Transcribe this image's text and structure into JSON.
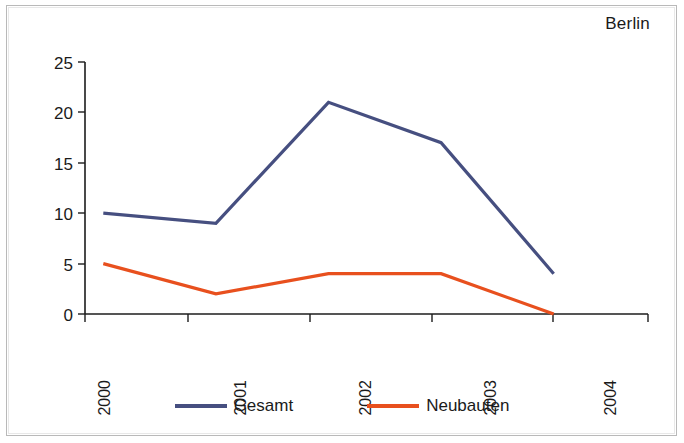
{
  "chart_data": {
    "type": "line",
    "title": "Berlin",
    "xlabel": "",
    "ylabel": "",
    "categories": [
      "2000",
      "2001",
      "2002",
      "2003",
      "2004"
    ],
    "series": [
      {
        "name": "Gesamt",
        "color": "#464f80",
        "values": [
          10,
          9,
          21,
          17,
          4
        ]
      },
      {
        "name": "Neubauten",
        "color": "#e8501e",
        "values": [
          5,
          2,
          4,
          4,
          0
        ]
      }
    ],
    "ylim": [
      0,
      25
    ],
    "yticks": [
      0,
      5,
      10,
      15,
      20,
      25
    ],
    "grid": false,
    "legend_position": "bottom",
    "xtick_rotation": -90
  },
  "legend": {
    "entries": [
      {
        "label": "Gesamt",
        "color": "#464f80"
      },
      {
        "label": "Neubauten",
        "color": "#e8501e"
      }
    ]
  },
  "axes": {
    "y_tick_labels": [
      "25",
      "20",
      "15",
      "10",
      "5",
      "0"
    ],
    "x_tick_labels": [
      "2000",
      "2001",
      "2002",
      "2003",
      "2004"
    ]
  },
  "colors": {
    "frame": "#b9b9b9",
    "axis": "#1c1c1c",
    "text": "#1a1a1a",
    "background": "#ffffff",
    "series_gesamt": "#464f80",
    "series_neubauten": "#e8501e"
  }
}
